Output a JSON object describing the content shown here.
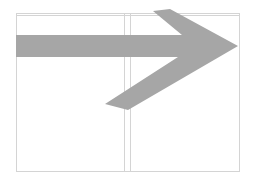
{
  "diagram": {
    "canvas": {
      "width": 254,
      "height": 184,
      "background": "#ffffff"
    },
    "frame": {
      "stroke": "#d4d4d4",
      "left": 16,
      "right": 239,
      "top": 13,
      "top_inner": 15,
      "bottom": 171,
      "dividers": [
        124,
        130
      ]
    },
    "arrow": {
      "fill": "#a6a6a6",
      "direction": "right",
      "points": "16,35 182,35 153,11 170,9 238,46 128,110 105,104 178,57 16,57"
    }
  }
}
